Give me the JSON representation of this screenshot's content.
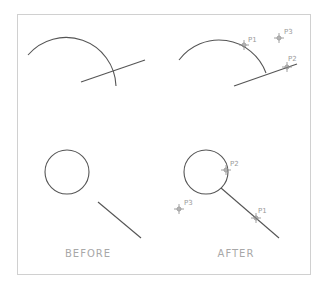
{
  "labels": {
    "before": "BEFORE",
    "after": "AFTER"
  },
  "after_top": {
    "p1": "P1",
    "p2": "P2",
    "p3": "P3"
  },
  "after_bottom": {
    "p1": "P1",
    "p2": "P2",
    "p3": "P3"
  },
  "colors": {
    "geometry": "#555555",
    "marker": "#888888",
    "frame": "#d0d0d0",
    "label": "#a8a8a8"
  }
}
